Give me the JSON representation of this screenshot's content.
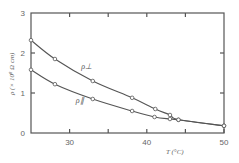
{
  "chart_data": {
    "type": "line",
    "title": "",
    "xlabel": "T (°C)",
    "ylabel": "ρ (× 10⁸ Ω cm)",
    "xlim": [
      25,
      50
    ],
    "ylim": [
      0,
      3
    ],
    "x_ticks": [
      30,
      35,
      40,
      45,
      50
    ],
    "x_tick_labels": [
      "30",
      "",
      "40",
      "",
      "50"
    ],
    "y_ticks": [
      0,
      1,
      2,
      3
    ],
    "y_tick_labels": [
      "0",
      "1",
      "2",
      "3"
    ],
    "grid": false,
    "legend": "inline curve labels",
    "series": [
      {
        "name": "ρ⊥",
        "x": [
          25.0,
          28.1,
          33.0,
          38.1,
          41.1,
          43.0,
          44.1,
          50.0
        ],
        "y": [
          2.32,
          1.85,
          1.3,
          0.88,
          0.6,
          0.45,
          0.33,
          0.18
        ]
      },
      {
        "name": "ρ∥",
        "x": [
          25.0,
          28.1,
          33.0,
          38.1,
          41.0,
          43.0,
          44.1,
          50.0
        ],
        "y": [
          1.58,
          1.22,
          0.85,
          0.55,
          0.4,
          0.35,
          0.33,
          0.18
        ]
      }
    ],
    "annotations": [
      {
        "text": "ρ⊥",
        "near_series": "ρ⊥",
        "x": 31.5,
        "y": 1.6
      },
      {
        "text": "ρ∥",
        "near_series": "ρ∥",
        "x": 30.8,
        "y": 0.75
      }
    ]
  }
}
